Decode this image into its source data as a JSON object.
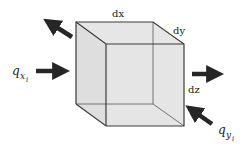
{
  "diagram": {
    "labels": {
      "dx": "dx",
      "dy": "dy",
      "dz": "dz",
      "qx_main": "q",
      "qx_sub": "x",
      "qx_subsub": "i",
      "qy_main": "q",
      "qy_sub": "y",
      "qy_subsub": "i"
    },
    "colors": {
      "face_fill": "#e2e2e2",
      "edge": "#3a3a3a",
      "arrow": "#262626"
    },
    "arrows": [
      {
        "name": "outflow-upper-left",
        "direction": "out"
      },
      {
        "name": "inflow-x",
        "direction": "in"
      },
      {
        "name": "outflow-right",
        "direction": "out"
      },
      {
        "name": "inflow-y",
        "direction": "in"
      }
    ]
  }
}
